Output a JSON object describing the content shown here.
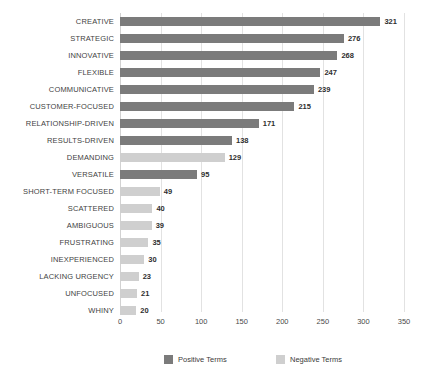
{
  "chart_data": {
    "type": "bar",
    "orientation": "horizontal",
    "title": "",
    "subtitle": "",
    "xlabel": "",
    "ylabel": "",
    "xlim": [
      0,
      350
    ],
    "xticks": [
      "0",
      "50",
      "100",
      "150",
      "200",
      "250",
      "300",
      "350"
    ],
    "grid": true,
    "legend_position": "bottom",
    "categories": [
      "CREATIVE",
      "STRATEGIC",
      "INNOVATIVE",
      "FLEXIBLE",
      "COMMUNICATIVE",
      "CUSTOMER-FOCUSED",
      "RELATIONSHIP-DRIVEN",
      "RESULTS-DRIVEN",
      "DEMANDING",
      "VERSATILE",
      "SHORT-TERM FOCUSED",
      "SCATTERED",
      "AMBIGUOUS",
      "FRUSTRATING",
      "INEXPERIENCED",
      "LACKING URGENCY",
      "UNFOCUSED",
      "WHINY"
    ],
    "values": [
      321,
      276,
      268,
      247,
      239,
      215,
      171,
      138,
      129,
      95,
      49,
      40,
      39,
      35,
      30,
      23,
      21,
      20
    ],
    "groups": [
      "positive",
      "positive",
      "positive",
      "positive",
      "positive",
      "positive",
      "positive",
      "positive",
      "negative",
      "positive",
      "negative",
      "negative",
      "negative",
      "negative",
      "negative",
      "negative",
      "negative",
      "negative"
    ],
    "series": [
      {
        "name": "Positive Terms",
        "color": "#7b7b7b",
        "points": [
          {
            "category": "CREATIVE",
            "value": 321
          },
          {
            "category": "STRATEGIC",
            "value": 276
          },
          {
            "category": "INNOVATIVE",
            "value": 268
          },
          {
            "category": "FLEXIBLE",
            "value": 247
          },
          {
            "category": "COMMUNICATIVE",
            "value": 239
          },
          {
            "category": "CUSTOMER-FOCUSED",
            "value": 215
          },
          {
            "category": "RELATIONSHIP-DRIVEN",
            "value": 171
          },
          {
            "category": "RESULTS-DRIVEN",
            "value": 138
          },
          {
            "category": "VERSATILE",
            "value": 95
          }
        ]
      },
      {
        "name": "Negative Terms",
        "color": "#cfcfcf",
        "points": [
          {
            "category": "DEMANDING",
            "value": 129
          },
          {
            "category": "SHORT-TERM FOCUSED",
            "value": 49
          },
          {
            "category": "SCATTERED",
            "value": 40
          },
          {
            "category": "AMBIGUOUS",
            "value": 39
          },
          {
            "category": "FRUSTRATING",
            "value": 35
          },
          {
            "category": "INEXPERIENCED",
            "value": 30
          },
          {
            "category": "LACKING URGENCY",
            "value": 23
          },
          {
            "category": "UNFOCUSED",
            "value": 21
          },
          {
            "category": "WHINY",
            "value": 20
          }
        ]
      }
    ]
  },
  "legend": {
    "items": [
      {
        "label": "Positive Terms",
        "color": "#7b7b7b"
      },
      {
        "label": "Negative Terms",
        "color": "#cfcfcf"
      }
    ]
  },
  "colors": {
    "positive": "#7b7b7b",
    "negative": "#cfcfcf",
    "gridline": "#e2e2e2",
    "text": "#3f3f3f",
    "background": "#ffffff"
  }
}
